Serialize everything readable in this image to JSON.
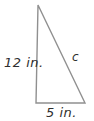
{
  "figure": {
    "type": "right-triangle-diagram",
    "labels": {
      "left_leg": "12 in.",
      "hypotenuse": "c",
      "bottom_leg": "5 in."
    },
    "colors": {
      "line": "#909090",
      "text": "#2e2e2e",
      "background": "#ffffff"
    }
  }
}
